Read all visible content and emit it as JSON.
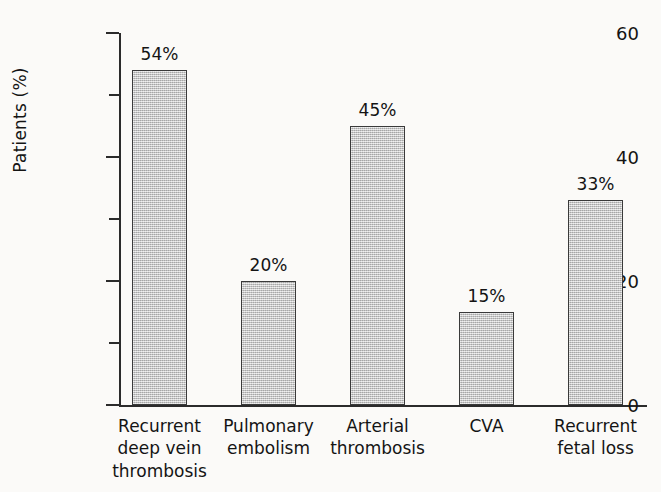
{
  "chart_data": {
    "type": "bar",
    "title": "",
    "xlabel": "",
    "ylabel": "Patients (%)",
    "ylim": [
      0,
      60
    ],
    "ytick_labels": [
      "0",
      "20",
      "40",
      "60"
    ],
    "ytick_values": [
      0,
      20,
      40,
      60
    ],
    "minor_tick_values": [
      10,
      30,
      50
    ],
    "grid": false,
    "legend": null,
    "categories": [
      "Recurrent deep vein thrombosis",
      "Pulmonary embolism",
      "Arterial thrombosis",
      "CVA",
      "Recurrent fetal loss"
    ],
    "category_lines": [
      [
        "Recurrent",
        "deep vein",
        "thrombosis"
      ],
      [
        "Pulmonary",
        "embolism"
      ],
      [
        "Arterial",
        "thrombosis"
      ],
      [
        "CVA"
      ],
      [
        "Recurrent",
        "fetal loss"
      ]
    ],
    "values": [
      54,
      20,
      45,
      15,
      33
    ],
    "data_labels": [
      "54%",
      "20%",
      "45%",
      "15%",
      "33%"
    ],
    "bar_fill_color": "#c6c6c6",
    "bar_edge_color": "#3a3a3a",
    "background_color": "#fbfaf8",
    "axis_color": "#2b2b2b"
  }
}
